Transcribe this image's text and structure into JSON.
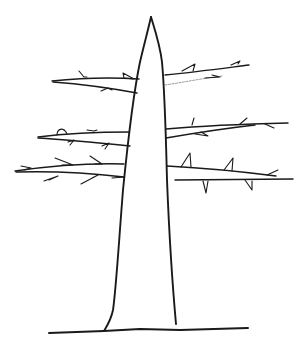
{
  "figure": {
    "title": "Line drawing of a tree trunk with thorny branches",
    "background": "#ffffff",
    "ink_color": "#1a1a1a",
    "parts": {
      "trunk": "tapered trunk",
      "ground": "ground line",
      "branches": [
        {
          "id": "upper-left",
          "side": "left"
        },
        {
          "id": "upper-right",
          "side": "right"
        },
        {
          "id": "middle-left",
          "side": "left"
        },
        {
          "id": "middle-right",
          "side": "right"
        },
        {
          "id": "lower-left",
          "side": "left"
        },
        {
          "id": "lower-right",
          "side": "right"
        }
      ]
    }
  }
}
